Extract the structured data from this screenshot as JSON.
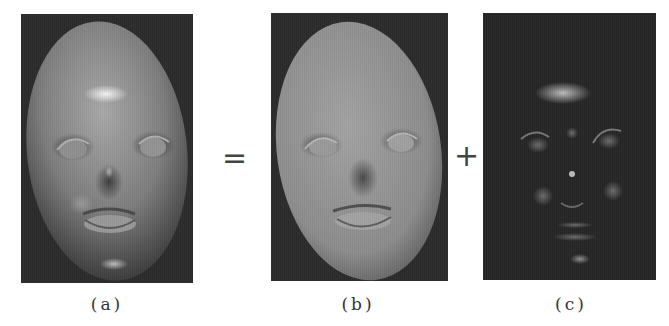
{
  "figure": {
    "operators": {
      "equals": "=",
      "plus": "+"
    },
    "panels": [
      {
        "id": "a",
        "label": "(a)",
        "content": "Rendered face with full shading (diffuse + specular)"
      },
      {
        "id": "b",
        "label": "(b)",
        "content": "Diffuse component of face"
      },
      {
        "id": "c",
        "label": "(c)",
        "content": "Specular highlight component"
      }
    ]
  },
  "colors": {
    "background": "#ffffff",
    "panel_bg": "#2b2b2b",
    "face_gray": "#8a8a8a",
    "text": "#333333"
  }
}
